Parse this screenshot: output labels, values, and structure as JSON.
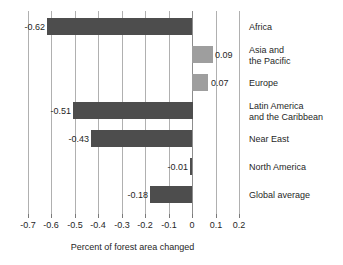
{
  "chart_data": {
    "type": "bar",
    "orientation": "horizontal",
    "title": "",
    "xlabel": "Percent of forest area changed",
    "ylabel": "",
    "xlim": [
      -0.7,
      0.2
    ],
    "grid": true,
    "legend": "none",
    "categories": [
      "Africa",
      "Asia and\nthe Pacific",
      "Europe",
      "Latin America\nand the Caribbean",
      "Near East",
      "North America",
      "Global average"
    ],
    "values": [
      -0.62,
      0.09,
      0.07,
      -0.51,
      -0.43,
      -0.01,
      -0.18
    ],
    "value_labels": [
      "-0.62",
      "0.09",
      "0.07",
      "-0.51",
      "-0.43",
      "-0.01",
      "-0.18"
    ],
    "xticks": [
      -0.7,
      -0.6,
      -0.5,
      -0.4,
      -0.3,
      -0.2,
      -0.1,
      0,
      0.1,
      0.2
    ],
    "xtick_labels": [
      "-0.7",
      "-0.6",
      "-0.5",
      "-0.4",
      "-0.3",
      "-0.2",
      "-0.1",
      "0",
      "0.1",
      "0.2"
    ],
    "colors": {
      "negative_bar": "#4d4d4d",
      "positive_bar": "#9e9e9e",
      "gridline": "#b0b0b0",
      "zero_line": "#8d8d8d",
      "text": "#1f1f1f",
      "background": "#ffffff"
    }
  }
}
